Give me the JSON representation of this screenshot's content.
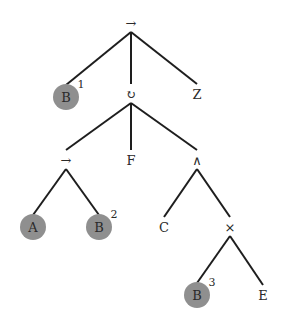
{
  "diagram": {
    "type": "tree",
    "highlight_color": "#8f8f8f",
    "nodes": [
      {
        "id": "n0",
        "label": "→",
        "highlighted": false,
        "superscript": ""
      },
      {
        "id": "n1",
        "label": "B",
        "highlighted": true,
        "superscript": "1"
      },
      {
        "id": "n2",
        "label": "↻",
        "highlighted": false,
        "superscript": ""
      },
      {
        "id": "n3",
        "label": "Z",
        "highlighted": false,
        "superscript": ""
      },
      {
        "id": "n4",
        "label": "→",
        "highlighted": false,
        "superscript": ""
      },
      {
        "id": "n5",
        "label": "F",
        "highlighted": false,
        "superscript": ""
      },
      {
        "id": "n6",
        "label": "∧",
        "highlighted": false,
        "superscript": ""
      },
      {
        "id": "n7",
        "label": "A",
        "highlighted": true,
        "superscript": ""
      },
      {
        "id": "n8",
        "label": "B",
        "highlighted": true,
        "superscript": "2"
      },
      {
        "id": "n9",
        "label": "C",
        "highlighted": false,
        "superscript": ""
      },
      {
        "id": "n10",
        "label": "×",
        "highlighted": false,
        "superscript": ""
      },
      {
        "id": "n11",
        "label": "B",
        "highlighted": true,
        "superscript": "3"
      },
      {
        "id": "n12",
        "label": "E",
        "highlighted": false,
        "superscript": ""
      }
    ],
    "edges": [
      [
        "n0",
        "n1"
      ],
      [
        "n0",
        "n2"
      ],
      [
        "n0",
        "n3"
      ],
      [
        "n2",
        "n4"
      ],
      [
        "n2",
        "n5"
      ],
      [
        "n2",
        "n6"
      ],
      [
        "n4",
        "n7"
      ],
      [
        "n4",
        "n8"
      ],
      [
        "n6",
        "n9"
      ],
      [
        "n6",
        "n10"
      ],
      [
        "n10",
        "n11"
      ],
      [
        "n10",
        "n12"
      ]
    ]
  }
}
